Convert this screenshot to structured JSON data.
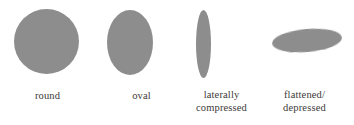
{
  "figure": {
    "background_color": "#ffffff",
    "shape_fill_color": "#8d8d8d",
    "caption_color": "#3d3a38",
    "specimens": [
      {
        "id": "round",
        "shape": "circle",
        "caption_lines": [
          "round"
        ]
      },
      {
        "id": "oval",
        "shape": "vertical-ellipse",
        "caption_lines": [
          "oval"
        ]
      },
      {
        "id": "laterally-compressed",
        "shape": "narrow-vertical-ellipse",
        "caption_lines": [
          "laterally",
          "compressed"
        ]
      },
      {
        "id": "flattened-depressed",
        "shape": "tilted-horizontal-ellipse",
        "caption_lines": [
          "flattened/",
          "depressed"
        ]
      }
    ]
  }
}
